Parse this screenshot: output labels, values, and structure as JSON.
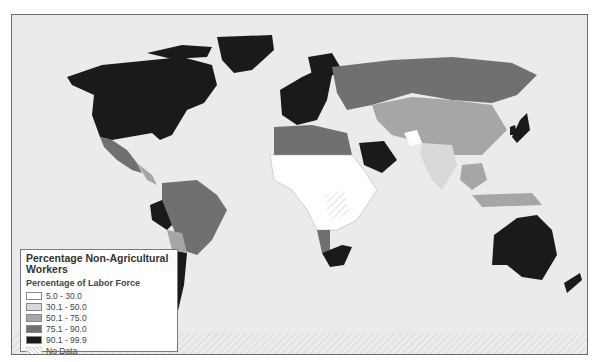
{
  "map": {
    "title": "Percentage Non-Agricultural Workers",
    "ocean_color": "#ebebeb",
    "legend": {
      "title": "Percentage Non-Agricultural Workers",
      "subtitle": "Percentage of Labor Force",
      "items": [
        {
          "label": "5.0 - 30.0",
          "color": "#ffffff"
        },
        {
          "label": "30.1 - 50.0",
          "color": "#d9d9d9"
        },
        {
          "label": "50.1 - 75.0",
          "color": "#a6a6a6"
        },
        {
          "label": "75.1 - 90.0",
          "color": "#707070"
        },
        {
          "label": "90.1 - 99.9",
          "color": "#1a1a1a"
        },
        {
          "label": "No Data",
          "color": "hatch"
        }
      ]
    },
    "regions": [
      {
        "name": "North America",
        "class": "90.1 - 99.9"
      },
      {
        "name": "Greenland",
        "class": "90.1 - 99.9"
      },
      {
        "name": "Mexico",
        "class": "75.1 - 90.0"
      },
      {
        "name": "Western Europe",
        "class": "90.1 - 99.9"
      },
      {
        "name": "Russia",
        "class": "75.1 - 90.0"
      },
      {
        "name": "China",
        "class": "50.1 - 75.0"
      },
      {
        "name": "India",
        "class": "30.1 - 50.0"
      },
      {
        "name": "Saudi Arabia",
        "class": "90.1 - 99.9"
      },
      {
        "name": "Japan",
        "class": "90.1 - 99.9"
      },
      {
        "name": "Brazil",
        "class": "75.1 - 90.0"
      },
      {
        "name": "Argentina",
        "class": "90.1 - 99.9"
      },
      {
        "name": "Central/West Africa",
        "class": "5.0 - 30.0"
      },
      {
        "name": "South Africa",
        "class": "90.1 - 99.9"
      },
      {
        "name": "Australia",
        "class": "90.1 - 99.9"
      },
      {
        "name": "New Zealand",
        "class": "90.1 - 99.9"
      }
    ]
  }
}
